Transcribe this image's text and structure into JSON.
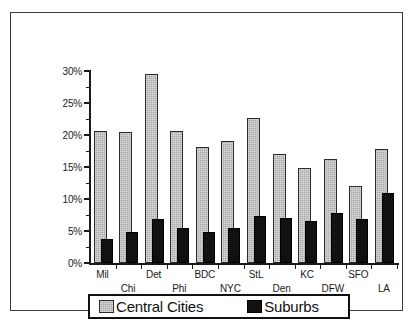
{
  "chart_data": {
    "type": "bar",
    "title": "",
    "subtitle": "",
    "xlabel": "",
    "ylabel": "",
    "categories": [
      "Mil",
      "Chi",
      "Det",
      "Phi",
      "BDC",
      "NYC",
      "StL",
      "Den",
      "KC",
      "DFW",
      "SFO",
      "LA"
    ],
    "series": [
      {
        "name": "Central Cities",
        "color": "#a8a8a8",
        "values": [
          20.6,
          20.5,
          29.5,
          20.6,
          18.2,
          19.1,
          22.6,
          17.0,
          14.9,
          16.3,
          12.0,
          17.8
        ]
      },
      {
        "name": "Suburbs",
        "color": "#111111",
        "values": [
          3.8,
          4.8,
          6.8,
          5.4,
          4.9,
          5.4,
          7.4,
          7.1,
          6.6,
          7.8,
          6.9,
          10.9
        ]
      }
    ],
    "ylim": [
      0,
      30
    ],
    "y_tick_values": [
      0,
      5,
      10,
      15,
      20,
      25,
      30
    ],
    "y_tick_labels": [
      "0%",
      "5%",
      "10%",
      "15%",
      "20%",
      "25%",
      "30%"
    ],
    "y_minor_tick_values": [
      2.5,
      7.5,
      12.5,
      17.5,
      22.5,
      27.5
    ],
    "grid": false,
    "legend_position": "bottom",
    "units": "percent",
    "x_label_rows": [
      0,
      1,
      0,
      1,
      0,
      1,
      0,
      1,
      0,
      1,
      0,
      1
    ]
  },
  "legend": {
    "entries": [
      {
        "label": "Central Cities",
        "swatch": "light-gray-hatched-swatch"
      },
      {
        "label": "Suburbs",
        "swatch": "black-swatch"
      }
    ]
  }
}
